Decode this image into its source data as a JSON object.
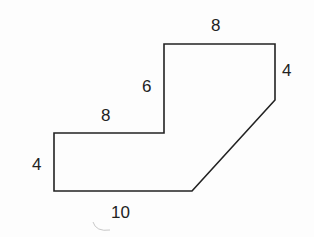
{
  "diagram": {
    "type": "polygon-with-side-lengths",
    "colors": {
      "stroke": "#222222",
      "text": "#222222",
      "background": "#fdfdfd",
      "artifact": "#c8c8c8"
    },
    "polygon_points": "54,133 164,133 164,44 275,44 275,100 192,191 54,191",
    "labels": [
      {
        "id": "top",
        "text": "8",
        "x": 211,
        "y": 17
      },
      {
        "id": "right",
        "text": "4",
        "x": 282,
        "y": 62
      },
      {
        "id": "inner-vertical",
        "text": "6",
        "x": 142,
        "y": 78
      },
      {
        "id": "middle-horizontal",
        "text": "8",
        "x": 101,
        "y": 107
      },
      {
        "id": "left",
        "text": "4",
        "x": 32,
        "y": 156
      },
      {
        "id": "bottom",
        "text": "10",
        "x": 111,
        "y": 204
      }
    ]
  }
}
